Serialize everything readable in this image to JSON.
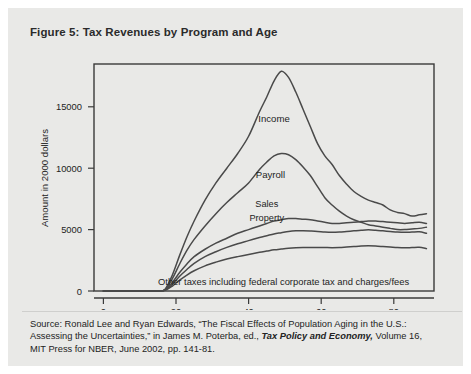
{
  "figure": {
    "title": "Figure 5: Tax Revenues by Program and Age",
    "source_line1": "Source: Ronald Lee and Ryan Edwards, “The Fiscal Effects of Population Aging in the U.S.:",
    "source_line2_a": "Assessing the Uncertainties,” in James M. Poterba, ed., ",
    "source_line2_italic": "Tax Policy and Economy,",
    "source_line2_b": " Volume 16,",
    "source_line3": "MIT Press for NBER, June 2002, pp. 141-81."
  },
  "colors": {
    "panel_background": "#e9e9e7",
    "plot_background": "#e9e9e7",
    "axis": "#3a3a3a",
    "curve": "#4a4a4a",
    "text": "#232323"
  },
  "chart_data": {
    "type": "line",
    "title": "Figure 5: Tax Revenues by Program and Age",
    "xlabel": "Age",
    "ylabel": "Amount in 2000 dollars",
    "xlim": [
      0,
      90
    ],
    "ylim": [
      0,
      18500
    ],
    "xticks": [
      0,
      20,
      40,
      60,
      80
    ],
    "xtick_labels": [
      "0",
      "20",
      "40",
      "60",
      "80"
    ],
    "yticks": [
      0,
      5000,
      10000,
      15000
    ],
    "ytick_labels": [
      "0",
      "5000",
      "10000",
      "15000"
    ],
    "grid": false,
    "legend": "inline-annotations",
    "annotation": "Other taxes including federal corporate tax and charges/fees",
    "x": [
      0,
      5,
      10,
      15,
      17,
      19,
      21,
      23,
      25,
      28,
      31,
      34,
      37,
      40,
      43,
      45,
      47,
      49,
      51,
      53,
      55,
      57,
      59,
      61,
      63,
      65,
      67,
      69,
      71,
      73,
      75,
      77,
      79,
      81,
      83,
      85,
      87,
      89
    ],
    "series": [
      {
        "name": "Income",
        "label": "Income",
        "label_x": 47,
        "label_y": 13800,
        "values": [
          0,
          0,
          0,
          0,
          150,
          1300,
          2900,
          4400,
          5700,
          7400,
          8800,
          10000,
          11200,
          12600,
          14600,
          15800,
          17100,
          17900,
          17400,
          16200,
          14800,
          13400,
          12000,
          11000,
          10300,
          9400,
          8700,
          8100,
          7700,
          7400,
          7200,
          7000,
          6600,
          6400,
          6300,
          6100,
          6200,
          6300
        ]
      },
      {
        "name": "Payroll",
        "label": "Payroll",
        "label_x": 46,
        "label_y": 9200,
        "values": [
          0,
          0,
          0,
          0,
          120,
          1000,
          2200,
          3300,
          4200,
          5300,
          6300,
          7200,
          8000,
          8800,
          9900,
          10500,
          11000,
          11200,
          11100,
          10700,
          10100,
          9400,
          8500,
          7600,
          7000,
          6500,
          6100,
          5800,
          5600,
          5400,
          5300,
          5200,
          5100,
          5000,
          5000,
          5050,
          5100,
          5200
        ]
      },
      {
        "name": "Sales",
        "label": "Sales",
        "label_x": 45,
        "label_y": 6850,
        "values": [
          0,
          0,
          0,
          0,
          90,
          700,
          1500,
          2200,
          2800,
          3400,
          3900,
          4300,
          4700,
          5000,
          5300,
          5500,
          5700,
          5800,
          5900,
          5900,
          5850,
          5800,
          5700,
          5600,
          5500,
          5500,
          5550,
          5600,
          5650,
          5700,
          5700,
          5650,
          5600,
          5550,
          5500,
          5550,
          5600,
          5500
        ]
      },
      {
        "name": "Property",
        "label": "Property",
        "label_x": 45,
        "label_y": 5700,
        "values": [
          0,
          0,
          0,
          0,
          70,
          550,
          1200,
          1750,
          2250,
          2800,
          3200,
          3550,
          3850,
          4100,
          4350,
          4500,
          4650,
          4750,
          4850,
          4900,
          4900,
          4880,
          4850,
          4800,
          4780,
          4800,
          4850,
          4900,
          4950,
          4980,
          4950,
          4900,
          4850,
          4800,
          4780,
          4800,
          4820,
          4700
        ]
      },
      {
        "name": "Other taxes",
        "label": "",
        "label_x": 0,
        "label_y": 0,
        "values": [
          0,
          0,
          0,
          0,
          50,
          400,
          880,
          1300,
          1650,
          2050,
          2350,
          2600,
          2800,
          2980,
          3150,
          3250,
          3350,
          3420,
          3480,
          3520,
          3540,
          3550,
          3550,
          3540,
          3530,
          3540,
          3580,
          3620,
          3660,
          3680,
          3660,
          3620,
          3580,
          3540,
          3520,
          3540,
          3560,
          3450
        ]
      }
    ]
  }
}
